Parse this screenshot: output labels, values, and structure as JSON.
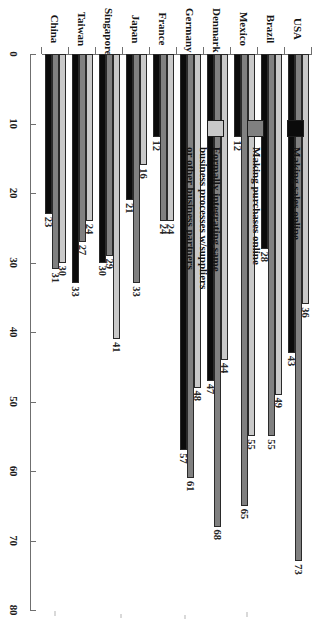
{
  "chart_data": {
    "type": "bar",
    "orientation": "horizontal",
    "rotated_page": true,
    "title": "",
    "xlabel": "Percent using Internet",
    "ylabel": "",
    "xlim": [
      0,
      80
    ],
    "xticks": [
      "0",
      "10",
      "20",
      "30",
      "40",
      "50",
      "60",
      "70",
      "80"
    ],
    "grid": false,
    "legend_position": "upper-left",
    "categories": [
      "USA",
      "Brazil",
      "Mexico",
      "Denmark",
      "Germany",
      "France",
      "Japan",
      "Singapore",
      "Taiwan",
      "China"
    ],
    "series": [
      {
        "name": "Making sales online",
        "color": "#0b0b0b",
        "values": [
          43,
          28,
          12,
          47,
          57,
          12,
          21,
          30,
          33,
          23
        ]
      },
      {
        "name": "Making purchases online",
        "color": "#808080",
        "values": [
          73,
          55,
          65,
          68,
          61,
          24,
          33,
          29,
          27,
          31
        ]
      },
      {
        "name": "Formally integrating same business processes w/suppliers or other business partners",
        "color": "#c9c9c9",
        "values": [
          36,
          49,
          55,
          44,
          48,
          24,
          16,
          41,
          24,
          30
        ]
      }
    ]
  },
  "legend": {
    "entries": [
      {
        "label": "Making sales online",
        "swatch": "black-swatch"
      },
      {
        "label": "Making purchases online",
        "swatch": "dark-gray-swatch"
      },
      {
        "label": "Formally integrating same\nbusiness processes w/suppliers\nor other business partners",
        "swatch": "light-gray-swatch"
      }
    ]
  },
  "axis": {
    "value_axis_title": "Percent using Internet",
    "value_ticks": [
      "0",
      "10",
      "20",
      "30",
      "40",
      "50",
      "60",
      "70",
      "80"
    ],
    "category_labels": [
      "USA",
      "Brazil",
      "Mexico",
      "Denmark",
      "Germany",
      "France",
      "Japan",
      "Singapore",
      "Taiwan",
      "China"
    ]
  },
  "colors": {
    "series_sales": "#0b0b0b",
    "series_purchases": "#808080",
    "series_integration": "#c9c9c9",
    "axis": "#6f6f6f",
    "background": "#ffffff"
  }
}
